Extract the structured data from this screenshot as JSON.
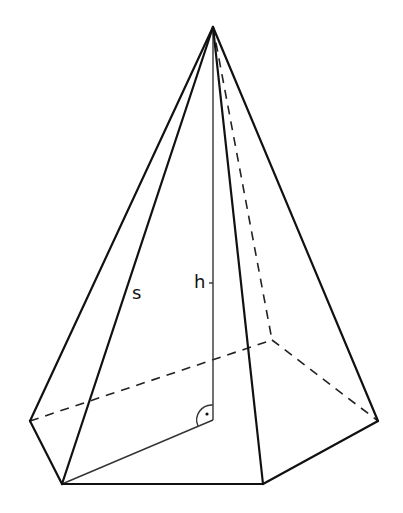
{
  "diagram": {
    "labels": {
      "slant_edge": "s",
      "height": "h"
    },
    "colors": {
      "line": "#111111",
      "background": "#ffffff"
    },
    "vertices": {
      "apex": [
        213,
        27
      ],
      "foot": [
        213,
        420
      ],
      "left": [
        30,
        421
      ],
      "front_left": [
        62,
        484
      ],
      "front_right": [
        263,
        484
      ],
      "right": [
        378,
        421
      ],
      "back": [
        272,
        340
      ]
    },
    "right_angle_marker": "arc-with-dot"
  }
}
